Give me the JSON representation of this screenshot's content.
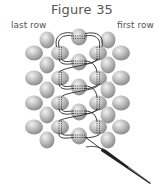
{
  "figure": {
    "title": "Figure 35",
    "labels": {
      "left": "last row",
      "right": "first row"
    }
  },
  "colors": {
    "bead_light": "#ececec",
    "bead_mid": "#bdbdbd",
    "bead_dark": "#8e8e8e",
    "thread": "#3a3a3a",
    "text": "#555555"
  }
}
